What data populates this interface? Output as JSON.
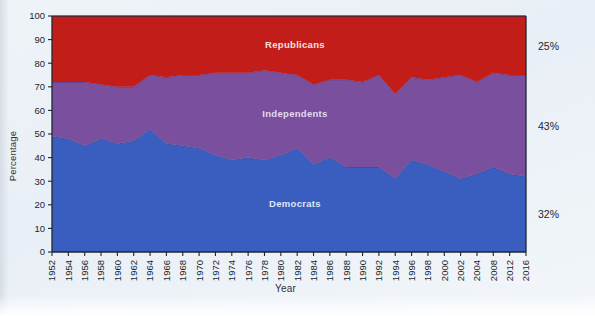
{
  "chart_data": {
    "type": "area",
    "stacked": true,
    "title": "",
    "subtitle": "",
    "xlabel": "Year",
    "ylabel": "Percentage",
    "ylim": [
      0,
      100
    ],
    "ytick_step": 10,
    "yticks": [
      0,
      10,
      20,
      30,
      40,
      50,
      60,
      70,
      80,
      90,
      100
    ],
    "grid": false,
    "legend_position": "inline-on-bands",
    "xlim": [
      1952,
      2016
    ],
    "x": [
      1952,
      1954,
      1956,
      1958,
      1960,
      1962,
      1964,
      1966,
      1968,
      1970,
      1972,
      1974,
      1976,
      1978,
      1980,
      1982,
      1984,
      1986,
      1988,
      1990,
      1992,
      1994,
      1996,
      1998,
      2000,
      2002,
      2004,
      2008,
      2012,
      2016
    ],
    "xtick_labels": [
      "1952",
      "1954",
      "1956",
      "1958",
      "1960",
      "1962",
      "1964",
      "1966",
      "1968",
      "1970",
      "1972",
      "1974",
      "1976",
      "1978",
      "1980",
      "1982",
      "1984",
      "1986",
      "1988",
      "1990",
      "1992",
      "1994",
      "1996",
      "1998",
      "2000",
      "2002",
      "2004",
      "2008",
      "2012",
      "2016"
    ],
    "series": [
      {
        "name": "Democrats",
        "color": "#3a5ec0",
        "label_color": "#dfe6f7",
        "end_label": "32%",
        "values": [
          49,
          48,
          45,
          48,
          46,
          47,
          52,
          46,
          45,
          44,
          41,
          39,
          40,
          39,
          41,
          44,
          37,
          40,
          36,
          36,
          36,
          31,
          39,
          37,
          34,
          31,
          33,
          36,
          33,
          32
        ]
      },
      {
        "name": "Independents",
        "color": "#7a4f9e",
        "label_color": "#e2dcf0",
        "end_label": "43%",
        "values": [
          23,
          24,
          27,
          23,
          24,
          23,
          23,
          28,
          30,
          31,
          35,
          37,
          36,
          38,
          35,
          31,
          34,
          33,
          37,
          36,
          39,
          36,
          35,
          36,
          40,
          44,
          39,
          40,
          42,
          43
        ]
      },
      {
        "name": "Republicans",
        "color": "#c21d18",
        "label_color": "#f6e2e0",
        "end_label": "25%",
        "values": [
          28,
          28,
          28,
          29,
          30,
          30,
          25,
          26,
          25,
          25,
          24,
          24,
          24,
          23,
          24,
          25,
          29,
          27,
          27,
          28,
          25,
          33,
          26,
          27,
          26,
          25,
          28,
          24,
          25,
          25
        ]
      }
    ]
  },
  "axis": {
    "y_title": "Percentage",
    "x_title": "Year"
  }
}
